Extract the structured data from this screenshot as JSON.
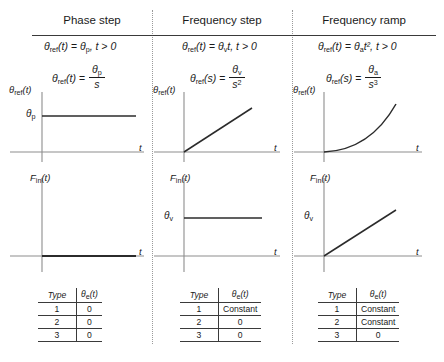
{
  "figure": {
    "columns": [
      {
        "title": "Phase step",
        "time_domain": {
          "lhs": "θ",
          "lhs_sub": "ref",
          "lhs_arg": "(t)",
          "eq": "=",
          "rhs_sym": "θ",
          "rhs_sub": "p",
          "rhs_tail": ", t > 0"
        },
        "laplace": {
          "lhs": "θ",
          "lhs_sub": "ref",
          "lhs_arg": "(t)",
          "num_sym": "θ",
          "num_sub": "p",
          "den": "s",
          "den_sup": ""
        },
        "plot_top": {
          "ylabel_sym": "θ",
          "ylabel_sub": "ref",
          "ylabel_arg": "(t)",
          "xlabel": "t",
          "tick_sym": "θ",
          "tick_sub": "p",
          "shape": "step"
        },
        "plot_bottom": {
          "ylabel": "F",
          "ylabel_sub": "in",
          "ylabel_arg": "(t)",
          "xlabel": "t",
          "tick_sym": "",
          "tick_sub": "",
          "shape": "zero"
        },
        "table": {
          "header_type": "Type",
          "header_err_sym": "θ",
          "header_err_sub": "e",
          "header_err_arg": "(t)",
          "rows": [
            {
              "type": "1",
              "error": "0"
            },
            {
              "type": "2",
              "error": "0"
            },
            {
              "type": "3",
              "error": "0"
            }
          ]
        }
      },
      {
        "title": "Frequency step",
        "time_domain": {
          "lhs": "θ",
          "lhs_sub": "ref",
          "lhs_arg": "(t)",
          "eq": "=",
          "rhs_sym": "θ",
          "rhs_sub": "v",
          "rhs_tail": "t, t > 0"
        },
        "laplace": {
          "lhs": "θ",
          "lhs_sub": "ref",
          "lhs_arg": "(s)",
          "num_sym": "θ",
          "num_sub": "v",
          "den": "s",
          "den_sup": "2"
        },
        "plot_top": {
          "ylabel_sym": "θ",
          "ylabel_sub": "ref",
          "ylabel_arg": "(t)",
          "xlabel": "t",
          "tick_sym": "",
          "tick_sub": "",
          "shape": "ramp"
        },
        "plot_bottom": {
          "ylabel": "F",
          "ylabel_sub": "in",
          "ylabel_arg": "(t)",
          "xlabel": "t",
          "tick_sym": "θ",
          "tick_sub": "v",
          "shape": "step"
        },
        "table": {
          "header_type": "Type",
          "header_err_sym": "θ",
          "header_err_sub": "e",
          "header_err_arg": "(t)",
          "rows": [
            {
              "type": "1",
              "error": "Constant"
            },
            {
              "type": "2",
              "error": "0"
            },
            {
              "type": "3",
              "error": "0"
            }
          ]
        }
      },
      {
        "title": "Frequency ramp",
        "time_domain": {
          "lhs": "θ",
          "lhs_sub": "ref",
          "lhs_arg": "(t)",
          "eq": "=",
          "rhs_sym": "θ",
          "rhs_sub": "a",
          "rhs_tail": "t², t > 0"
        },
        "laplace": {
          "lhs": "θ",
          "lhs_sub": "ref",
          "lhs_arg": "(s)",
          "num_sym": "θ",
          "num_sub": "a",
          "den": "s",
          "den_sup": "3"
        },
        "plot_top": {
          "ylabel_sym": "θ",
          "ylabel_sub": "ref",
          "ylabel_arg": "(t)",
          "xlabel": "t",
          "tick_sym": "",
          "tick_sub": "",
          "shape": "parabola"
        },
        "plot_bottom": {
          "ylabel": "F",
          "ylabel_sub": "in",
          "ylabel_arg": "(t)",
          "xlabel": "t",
          "tick_sym": "θ",
          "tick_sub": "v",
          "shape": "ramp"
        },
        "table": {
          "header_type": "Type",
          "header_err_sym": "θ",
          "header_err_sub": "e",
          "header_err_arg": "(t)",
          "rows": [
            {
              "type": "1",
              "error": "Constant"
            },
            {
              "type": "2",
              "error": "Constant"
            },
            {
              "type": "3",
              "error": "0"
            }
          ]
        }
      }
    ],
    "colors": {
      "ink": "#1a1a1a",
      "axis": "#8d8d8d",
      "curve": "#2b2b2b",
      "rule": "#3a3a3a"
    }
  }
}
